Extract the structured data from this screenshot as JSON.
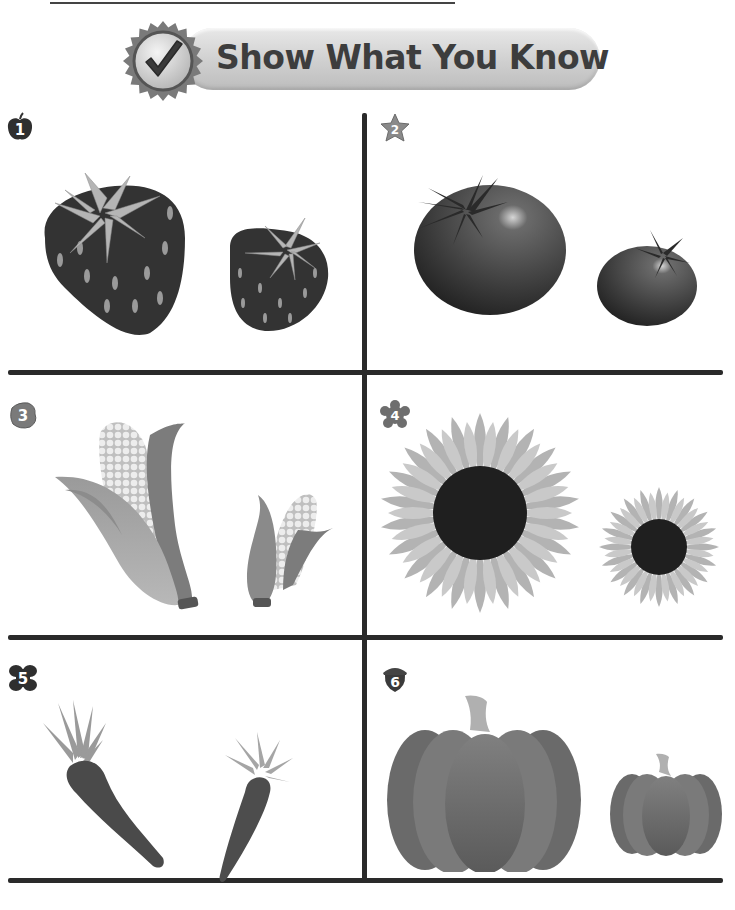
{
  "header": {
    "title": "Show What You Know",
    "badge_icon": "checkmark-icon"
  },
  "items": [
    {
      "number": "1",
      "badge_shape": "apple",
      "subject": "strawberry",
      "pair": [
        "big strawberry",
        "small strawberry"
      ]
    },
    {
      "number": "2",
      "badge_shape": "star",
      "subject": "tomato",
      "pair": [
        "big tomato",
        "small tomato"
      ]
    },
    {
      "number": "3",
      "badge_shape": "leaf",
      "subject": "corn",
      "pair": [
        "big corn",
        "small corn"
      ]
    },
    {
      "number": "4",
      "badge_shape": "flower",
      "subject": "sunflower",
      "pair": [
        "big sunflower",
        "small sunflower"
      ]
    },
    {
      "number": "5",
      "badge_shape": "butterfly",
      "subject": "carrot",
      "pair": [
        "big carrot",
        "small carrot"
      ]
    },
    {
      "number": "6",
      "badge_shape": "acorn",
      "subject": "pumpkin",
      "pair": [
        "big pumpkin",
        "small pumpkin"
      ]
    }
  ],
  "colors": {
    "ink": "#2a2a2a",
    "banner_fill": "#d6d6d6",
    "banner_text": "#3d3d3d"
  }
}
